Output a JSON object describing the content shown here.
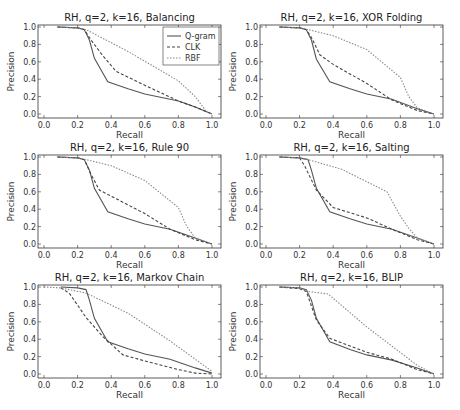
{
  "figure": {
    "legend_labels": [
      "Q-gram",
      "CLK",
      "RBF"
    ]
  },
  "chart_data": [
    {
      "type": "line",
      "title": "RH, q=2, k=16, Balancing",
      "xlabel": "Recall",
      "ylabel": "Precision",
      "xlim": [
        0,
        1
      ],
      "ylim": [
        0,
        1
      ],
      "xticks": [
        "0.0",
        "0.2",
        "0.4",
        "0.6",
        "0.8",
        "1.0"
      ],
      "yticks": [
        "0.0",
        "0.2",
        "0.4",
        "0.6",
        "0.8",
        "1.0"
      ],
      "grid": false,
      "legend": "top-right",
      "series": [
        {
          "name": "Q-gram",
          "style": "solid",
          "x": [
            0.08,
            0.2,
            0.24,
            0.27,
            0.3,
            0.38,
            0.5,
            0.6,
            0.8,
            0.9,
            1.0
          ],
          "y": [
            1.0,
            0.99,
            0.97,
            0.85,
            0.64,
            0.37,
            0.29,
            0.23,
            0.15,
            0.08,
            0.0
          ]
        },
        {
          "name": "CLK",
          "style": "dashed",
          "x": [
            0.08,
            0.2,
            0.24,
            0.28,
            0.35,
            0.43,
            0.6,
            0.8,
            0.9,
            1.0
          ],
          "y": [
            1.0,
            0.99,
            0.97,
            0.85,
            0.67,
            0.49,
            0.33,
            0.15,
            0.08,
            0.0
          ]
        },
        {
          "name": "RBF",
          "style": "dotted",
          "x": [
            0.08,
            0.2,
            0.25,
            0.5,
            0.8,
            0.9,
            0.97,
            1.0
          ],
          "y": [
            1.0,
            0.99,
            0.97,
            0.72,
            0.38,
            0.2,
            0.02,
            0.0
          ]
        }
      ]
    },
    {
      "type": "line",
      "title": "RH, q=2, k=16, XOR Folding",
      "xlabel": "Recall",
      "ylabel": "Precision",
      "xlim": [
        0,
        1
      ],
      "ylim": [
        0,
        1
      ],
      "xticks": [
        "0.0",
        "0.2",
        "0.4",
        "0.6",
        "0.8",
        "1.0"
      ],
      "yticks": [
        "0.0",
        "0.2",
        "0.4",
        "0.6",
        "0.8",
        "1.0"
      ],
      "grid": false,
      "series": [
        {
          "name": "Q-gram",
          "style": "solid",
          "x": [
            0.08,
            0.2,
            0.24,
            0.27,
            0.3,
            0.38,
            0.5,
            0.6,
            0.75,
            0.9,
            1.0
          ],
          "y": [
            1.0,
            0.99,
            0.97,
            0.85,
            0.63,
            0.37,
            0.29,
            0.23,
            0.17,
            0.06,
            0.0
          ]
        },
        {
          "name": "CLK",
          "style": "dashed",
          "x": [
            0.08,
            0.2,
            0.24,
            0.27,
            0.32,
            0.4,
            0.6,
            0.75,
            0.9,
            1.0
          ],
          "y": [
            1.0,
            0.99,
            0.97,
            0.88,
            0.68,
            0.57,
            0.35,
            0.16,
            0.04,
            0.0
          ]
        },
        {
          "name": "RBF",
          "style": "dotted",
          "x": [
            0.08,
            0.2,
            0.25,
            0.4,
            0.6,
            0.8,
            0.85,
            0.9,
            1.0
          ],
          "y": [
            1.0,
            0.99,
            0.97,
            0.9,
            0.74,
            0.42,
            0.2,
            0.07,
            0.0
          ]
        }
      ]
    },
    {
      "type": "line",
      "title": "RH, q=2, k=16, Rule 90",
      "xlabel": "Recall",
      "ylabel": "Precision",
      "xlim": [
        0,
        1
      ],
      "ylim": [
        0,
        1
      ],
      "xticks": [
        "0.0",
        "0.2",
        "0.4",
        "0.6",
        "0.8",
        "1.0"
      ],
      "yticks": [
        "0.0",
        "0.2",
        "0.4",
        "0.6",
        "0.8",
        "1.0"
      ],
      "grid": false,
      "series": [
        {
          "name": "Q-gram",
          "style": "solid",
          "x": [
            0.08,
            0.2,
            0.24,
            0.27,
            0.3,
            0.38,
            0.5,
            0.6,
            0.75,
            0.9,
            1.0
          ],
          "y": [
            1.0,
            0.99,
            0.97,
            0.85,
            0.64,
            0.37,
            0.29,
            0.23,
            0.17,
            0.07,
            0.0
          ]
        },
        {
          "name": "CLK",
          "style": "dashed",
          "x": [
            0.08,
            0.2,
            0.24,
            0.28,
            0.33,
            0.45,
            0.6,
            0.75,
            0.9,
            1.0
          ],
          "y": [
            1.0,
            0.99,
            0.97,
            0.8,
            0.62,
            0.5,
            0.35,
            0.17,
            0.05,
            0.0
          ]
        },
        {
          "name": "RBF",
          "style": "dotted",
          "x": [
            0.08,
            0.2,
            0.25,
            0.4,
            0.6,
            0.8,
            0.85,
            0.9,
            1.0
          ],
          "y": [
            1.0,
            0.99,
            0.97,
            0.9,
            0.73,
            0.42,
            0.2,
            0.07,
            0.0
          ]
        }
      ]
    },
    {
      "type": "line",
      "title": "RH, q=2, k=16, Salting",
      "xlabel": "Recall",
      "ylabel": "Precision",
      "xlim": [
        0,
        1
      ],
      "ylim": [
        0,
        1
      ],
      "xticks": [
        "0.0",
        "0.2",
        "0.4",
        "0.6",
        "0.8",
        "1.0"
      ],
      "yticks": [
        "0.0",
        "0.2",
        "0.4",
        "0.6",
        "0.8",
        "1.0"
      ],
      "grid": false,
      "series": [
        {
          "name": "Q-gram",
          "style": "solid",
          "x": [
            0.08,
            0.2,
            0.25,
            0.27,
            0.3,
            0.38,
            0.5,
            0.6,
            0.75,
            0.9,
            1.0
          ],
          "y": [
            1.0,
            0.99,
            0.97,
            0.85,
            0.64,
            0.37,
            0.29,
            0.23,
            0.17,
            0.07,
            0.0
          ]
        },
        {
          "name": "CLK",
          "style": "dashed",
          "x": [
            0.08,
            0.2,
            0.23,
            0.3,
            0.4,
            0.6,
            0.75,
            0.9,
            1.0
          ],
          "y": [
            1.0,
            0.99,
            0.9,
            0.62,
            0.42,
            0.3,
            0.17,
            0.05,
            0.0
          ]
        },
        {
          "name": "RBF",
          "style": "dotted",
          "x": [
            0.08,
            0.2,
            0.25,
            0.45,
            0.72,
            0.8,
            0.85,
            0.9,
            1.0
          ],
          "y": [
            1.0,
            0.99,
            0.97,
            0.86,
            0.6,
            0.32,
            0.18,
            0.07,
            0.0
          ]
        }
      ]
    },
    {
      "type": "line",
      "title": "RH, q=2, k=16, Markov Chain",
      "xlabel": "Recall",
      "ylabel": "Precision",
      "xlim": [
        0,
        1
      ],
      "ylim": [
        0,
        1
      ],
      "xticks": [
        "0.0",
        "0.2",
        "0.4",
        "0.6",
        "0.8",
        "1.0"
      ],
      "yticks": [
        "0.0",
        "0.2",
        "0.4",
        "0.6",
        "0.8",
        "1.0"
      ],
      "grid": false,
      "series": [
        {
          "name": "Q-gram",
          "style": "solid",
          "x": [
            0.1,
            0.2,
            0.25,
            0.27,
            0.3,
            0.38,
            0.5,
            0.6,
            0.75,
            0.9,
            1.0
          ],
          "y": [
            1.0,
            0.99,
            0.97,
            0.85,
            0.64,
            0.37,
            0.29,
            0.23,
            0.17,
            0.07,
            0.01
          ]
        },
        {
          "name": "CLK",
          "style": "dashed",
          "x": [
            0.1,
            0.15,
            0.25,
            0.35,
            0.47,
            0.6,
            0.8,
            0.9,
            1.0
          ],
          "y": [
            0.99,
            0.93,
            0.65,
            0.43,
            0.22,
            0.15,
            0.05,
            0.01,
            0.0
          ]
        },
        {
          "name": "RBF",
          "style": "dotted",
          "x": [
            0.0,
            0.1,
            0.25,
            0.5,
            0.75,
            1.0
          ],
          "y": [
            1.0,
            0.99,
            0.93,
            0.7,
            0.38,
            0.03
          ]
        }
      ]
    },
    {
      "type": "line",
      "title": "RH, q=2, k=16, BLIP",
      "xlabel": "Recall",
      "ylabel": "Precision",
      "xlim": [
        0,
        1
      ],
      "ylim": [
        0,
        1
      ],
      "xticks": [
        "0.0",
        "0.2",
        "0.4",
        "0.6",
        "0.8",
        "1.0"
      ],
      "yticks": [
        "0.0",
        "0.2",
        "0.4",
        "0.6",
        "0.8",
        "1.0"
      ],
      "grid": false,
      "series": [
        {
          "name": "Q-gram",
          "style": "solid",
          "x": [
            0.08,
            0.2,
            0.24,
            0.27,
            0.3,
            0.38,
            0.5,
            0.6,
            0.75,
            0.9,
            1.0
          ],
          "y": [
            1.0,
            0.99,
            0.97,
            0.85,
            0.64,
            0.37,
            0.28,
            0.22,
            0.16,
            0.07,
            0.0
          ]
        },
        {
          "name": "CLK",
          "style": "dashed",
          "x": [
            0.08,
            0.2,
            0.24,
            0.3,
            0.38,
            0.6,
            0.75,
            0.9,
            1.0
          ],
          "y": [
            1.0,
            0.98,
            0.95,
            0.62,
            0.41,
            0.25,
            0.17,
            0.05,
            0.0
          ]
        },
        {
          "name": "RBF",
          "style": "dotted",
          "x": [
            0.08,
            0.2,
            0.25,
            0.37,
            0.6,
            0.9,
            1.0
          ],
          "y": [
            1.0,
            0.99,
            0.95,
            0.92,
            0.54,
            0.1,
            0.0
          ]
        }
      ]
    }
  ]
}
